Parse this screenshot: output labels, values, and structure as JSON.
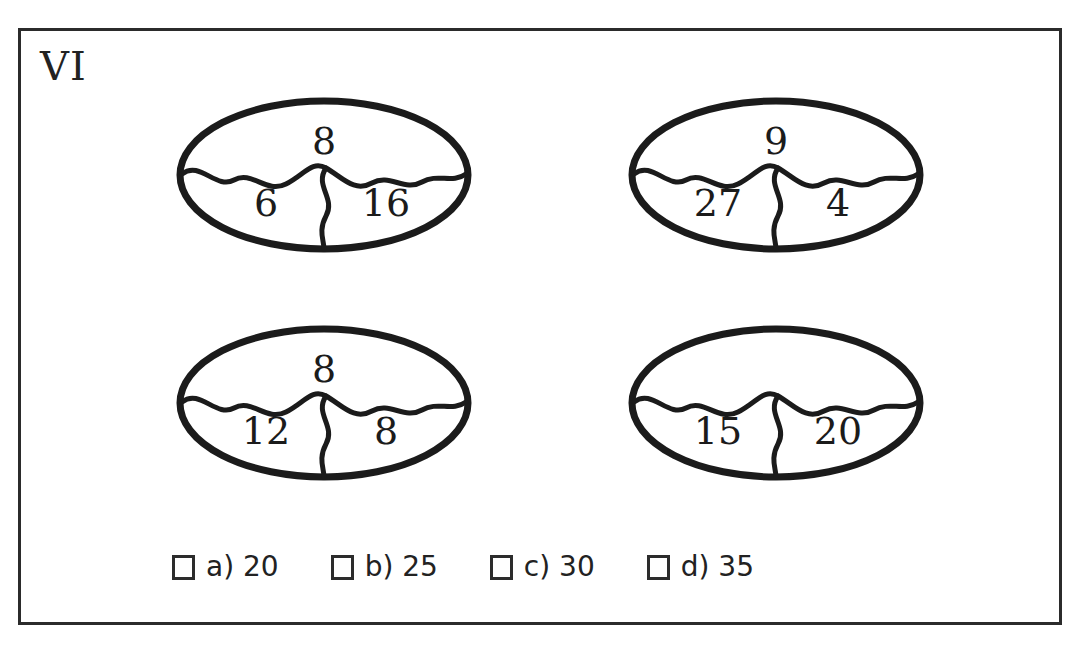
{
  "worksheet": {
    "problem_label": "VI",
    "background_color": "#ffffff",
    "ink_color": "#222222",
    "frame_color": "#2b2b2b"
  },
  "puzzles": [
    {
      "id": "oval-1",
      "top": "8",
      "bottom_left": "6",
      "bottom_right": "16"
    },
    {
      "id": "oval-2",
      "top": "9",
      "bottom_left": "27",
      "bottom_right": "4"
    },
    {
      "id": "oval-3",
      "top": "8",
      "bottom_left": "12",
      "bottom_right": "8"
    },
    {
      "id": "oval-4",
      "top": "",
      "bottom_left": "15",
      "bottom_right": "20"
    }
  ],
  "options": [
    {
      "id": "a",
      "label": "a) 20",
      "checked": false
    },
    {
      "id": "b",
      "label": "b) 25",
      "checked": false
    },
    {
      "id": "c",
      "label": "c) 30",
      "checked": false
    },
    {
      "id": "d",
      "label": "d) 35",
      "checked": false
    }
  ]
}
